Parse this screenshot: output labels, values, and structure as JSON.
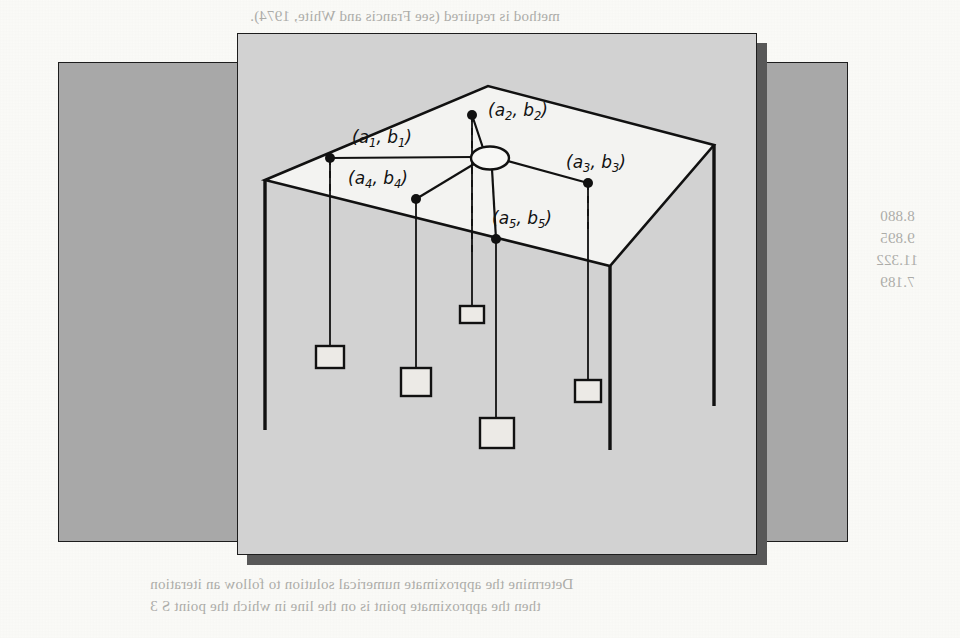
{
  "figure": {
    "type": "line-drawing",
    "node_labels": [
      {
        "id": "a1",
        "text_a": "(a",
        "sub_a": "1",
        "text_b": ", b",
        "sub_b": "1",
        "text_c": ")",
        "x": 352,
        "y": 143
      },
      {
        "id": "a2",
        "text_a": "(a",
        "sub_a": "2",
        "text_b": ", b",
        "sub_b": "2",
        "text_c": ")",
        "x": 488,
        "y": 116
      },
      {
        "id": "a3",
        "text_a": "(a",
        "sub_a": "3",
        "text_b": ", b",
        "sub_b": "3",
        "text_c": ")",
        "x": 566,
        "y": 168
      },
      {
        "id": "a4",
        "text_a": "(a",
        "sub_a": "4",
        "text_b": ", b",
        "sub_b": "4",
        "text_c": ")",
        "x": 348,
        "y": 184
      },
      {
        "id": "a5",
        "text_a": "(a",
        "sub_a": "5",
        "text_b": ", b",
        "sub_b": "5",
        "text_c": ")",
        "x": 492,
        "y": 224
      }
    ],
    "anchor_points": [
      {
        "id": "p1",
        "x": 330,
        "y": 158
      },
      {
        "id": "p2",
        "x": 472,
        "y": 115
      },
      {
        "id": "p3",
        "x": 588,
        "y": 183
      },
      {
        "id": "p4",
        "x": 416,
        "y": 199
      },
      {
        "id": "p5",
        "x": 496,
        "y": 239
      }
    ],
    "ring": {
      "cx": 490,
      "cy": 158,
      "rx": 18,
      "ry": 11
    },
    "weights": [
      {
        "id": "w1",
        "x": 330,
        "y": 346,
        "w": 28,
        "h": 22
      },
      {
        "id": "w2",
        "x": 416,
        "y": 368,
        "w": 30,
        "h": 28
      },
      {
        "id": "w3",
        "x": 460,
        "y": 306,
        "w": 24,
        "h": 17
      },
      {
        "id": "w4",
        "x": 497,
        "y": 418,
        "w": 34,
        "h": 30
      },
      {
        "id": "w5",
        "x": 585,
        "y": 380,
        "w": 26,
        "h": 22
      }
    ],
    "box": {
      "top_face": [
        [
          265,
          180
        ],
        [
          488,
          86
        ],
        [
          714,
          145
        ],
        [
          610,
          266
        ]
      ],
      "left_edge": {
        "x": 265,
        "y1": 180,
        "y2": 430
      },
      "front_edge": {
        "x": 610,
        "y1": 266,
        "y2": 450
      },
      "right_edge": {
        "x": 714,
        "y1": 145,
        "y2": 406
      }
    },
    "colors": {
      "page": "#fbfbf8",
      "outer_panel": "#a8a8a8",
      "inner_panel": "#d2d2d2",
      "shadow": "#585858",
      "top_face": "#f3f3f1",
      "ink": "#111111"
    }
  },
  "bleed_text": {
    "note": "Mirrored show-through text from the reverse side of the printed page.",
    "lines": [
      {
        "id": "b01",
        "text": "method is required (see Francis and White, 1974).",
        "x": 250,
        "y": 8,
        "size": 15
      },
      {
        "id": "b02",
        "text": "We are to solve the University Jackson Problem as",
        "x": 168,
        "y": 76,
        "size": 15
      },
      {
        "id": "b03",
        "text": "the most natural approach. Use the solution to find",
        "x": 168,
        "y": 98,
        "size": 15
      },
      {
        "id": "b04",
        "text": "Ga, Io)* = (7.622, 10.272). The residual s displaced",
        "x": 168,
        "y": 120,
        "size": 15
      },
      {
        "id": "b05",
        "text": "as the solution is the unique minimizer of the terms",
        "x": 168,
        "y": 142,
        "size": 15
      },
      {
        "id": "b06",
        "text": "W =  (7.589, 8.880)",
        "x": 330,
        "y": 208,
        "size": 15
      },
      {
        "id": "b07",
        "text": "V =  (7.102, 9.895)",
        "x": 330,
        "y": 230,
        "size": 15
      },
      {
        "id": "b08",
        "text": "Y =  (8.051, 11.322)",
        "x": 330,
        "y": 252,
        "size": 15
      },
      {
        "id": "b09",
        "text": "Z =  (6.926, 7.189)",
        "x": 330,
        "y": 274,
        "size": 15
      },
      {
        "id": "b10",
        "text": "Clearly, the residues are bounded in a convex set.",
        "x": 268,
        "y": 352,
        "size": 15
      },
      {
        "id": "b11",
        "text": "where the optimal solution is where s (B the key)",
        "x": 268,
        "y": 372,
        "size": 15
      },
      {
        "id": "b12",
        "text": "Problems for Section 11.4.9",
        "x": 322,
        "y": 458,
        "size": 22
      },
      {
        "id": "b13",
        "text": "Solve for the situation described in Problem 28",
        "x": 346,
        "y": 502,
        "size": 15
      },
      {
        "id": "b14",
        "text": "a.  Include gravity solution",
        "x": 370,
        "y": 534,
        "size": 15
      },
      {
        "id": "b15",
        "text": "Determine the approximate numerical solution to follow an iteration",
        "x": 150,
        "y": 576,
        "size": 15
      },
      {
        "id": "b16",
        "text": "then the approximate point is on the line in which the point S  3",
        "x": 150,
        "y": 598,
        "size": 15
      },
      {
        "id": "b17",
        "text": "8.880",
        "x": 880,
        "y": 208,
        "size": 15
      },
      {
        "id": "b18",
        "text": "9.895",
        "x": 880,
        "y": 230,
        "size": 15
      },
      {
        "id": "b19",
        "text": "11.322",
        "x": 876,
        "y": 252,
        "size": 15
      },
      {
        "id": "b20",
        "text": "7.189",
        "x": 880,
        "y": 274,
        "size": 15
      }
    ]
  }
}
